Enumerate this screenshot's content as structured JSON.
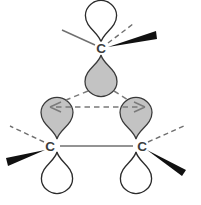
{
  "figure": {
    "background_color": "#ffffff"
  },
  "colors": {
    "lobe_shaded_fill": "#c3c3c3",
    "lobe_shaded_stroke": "#3a3a3a",
    "lobe_open_fill": "#ffffff",
    "lobe_open_stroke": "#2b2b2b",
    "bond_line": "#6f6f6f",
    "wedge_black": "#111111",
    "atom_label": "#3d3d3d",
    "overlap_arrow": "#7a7a7a"
  },
  "atoms": [
    {
      "id": "c-top",
      "label": "C",
      "x": 101,
      "y": 48,
      "position": "top"
    },
    {
      "id": "c-bottom-left",
      "label": "C",
      "x": 50,
      "y": 146,
      "position": "bottom-left"
    },
    {
      "id": "c-bottom-right",
      "label": "C",
      "x": 142,
      "y": 146,
      "position": "bottom-right"
    }
  ],
  "orbitals": [
    {
      "id": "p-top-open",
      "atom": "c-top",
      "type": "open",
      "direction": "up",
      "shape": "teardrop"
    },
    {
      "id": "p-top-shaded",
      "atom": "c-top",
      "type": "shaded",
      "direction": "down",
      "shape": "teardrop"
    },
    {
      "id": "p-left-shaded",
      "atom": "c-bottom-left",
      "type": "shaded",
      "direction": "up",
      "shape": "teardrop"
    },
    {
      "id": "p-left-open",
      "atom": "c-bottom-left",
      "type": "open",
      "direction": "down",
      "shape": "teardrop"
    },
    {
      "id": "p-right-shaded",
      "atom": "c-bottom-right",
      "type": "shaded",
      "direction": "up",
      "shape": "teardrop"
    },
    {
      "id": "p-right-open",
      "atom": "c-bottom-right",
      "type": "open",
      "direction": "down",
      "shape": "teardrop"
    }
  ],
  "bonds": [
    {
      "id": "bond-bottom",
      "from": "c-bottom-left",
      "to": "c-bottom-right",
      "style": "plain-line"
    },
    {
      "id": "bond-top-left",
      "from": "c-top",
      "to": "substituent",
      "style": "plain-line",
      "direction": "upper-left"
    },
    {
      "id": "bond-top-right",
      "from": "c-top",
      "to": "substituent",
      "style": "dashed-line",
      "direction": "upper-right"
    },
    {
      "id": "bond-top-wedge",
      "from": "c-top",
      "to": "substituent",
      "style": "bold-wedge",
      "direction": "right"
    },
    {
      "id": "bond-left-dashed",
      "from": "c-bottom-left",
      "to": "substituent",
      "style": "dashed-line",
      "direction": "upper-left"
    },
    {
      "id": "bond-left-wedge",
      "from": "c-bottom-left",
      "to": "substituent",
      "style": "bold-wedge",
      "direction": "lower-left"
    },
    {
      "id": "bond-right-dashed",
      "from": "c-bottom-right",
      "to": "substituent",
      "style": "dashed-line",
      "direction": "upper-right"
    },
    {
      "id": "bond-right-wedge",
      "from": "c-bottom-right",
      "to": "substituent",
      "style": "bold-wedge",
      "direction": "lower-right"
    }
  ],
  "overlap_arrows": [
    {
      "id": "overlap-horizontal",
      "from": "p-left-shaded",
      "to": "p-right-shaded",
      "style": "dashed",
      "heads": "both"
    },
    {
      "id": "overlap-top-left",
      "from": "p-top-shaded",
      "to": "p-left-shaded",
      "style": "dashed",
      "heads": "none"
    },
    {
      "id": "overlap-top-right",
      "from": "p-top-shaded",
      "to": "p-right-shaded",
      "style": "dashed",
      "heads": "none"
    }
  ]
}
